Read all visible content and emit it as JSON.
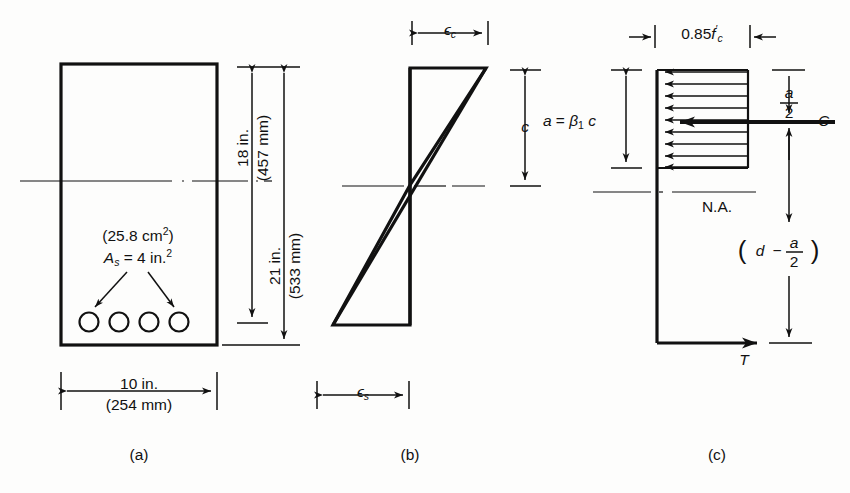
{
  "figure": {
    "title_parts": [
      "(a)",
      "(b)",
      "(c)"
    ],
    "panel_a": {
      "caption": "(a)",
      "area_metric": "(25.8 cm",
      "area_metric_sup": "2",
      "area_metric_close": ")",
      "as_symbol": "A",
      "as_sub": "s",
      "as_value": " = 4 in.",
      "as_sup": "2",
      "dim_depth_in": "18 in.",
      "dim_depth_mm": "(457 mm)",
      "dim_total_in": "21 in.",
      "dim_total_mm": "(533 mm)",
      "dim_width_in": "10 in.",
      "dim_width_mm": "(254 mm)",
      "rebar_count": 4
    },
    "panel_b": {
      "caption": "(b)",
      "strain_top_symbol": "ϵ",
      "strain_top_sub": "c",
      "strain_bottom_symbol": "ϵ",
      "strain_bottom_sub": "s",
      "neutral_depth_label": "c"
    },
    "panel_c": {
      "caption": "(c)",
      "stress_label_prefix": "0.85",
      "stress_label_f": "f",
      "stress_label_prime": "′",
      "stress_label_sub": "c",
      "depth_eq_prefix": "a",
      "depth_eq_equals": " = ",
      "depth_eq_beta": "β",
      "depth_eq_beta_sub": "1",
      "depth_eq_c": "c",
      "half_a_num": "a",
      "half_a_den": "2",
      "compression_label": "C",
      "tension_label": "T",
      "neutral_axis_label": "N.A.",
      "lever_arm_open": "(",
      "lever_arm_d": "d",
      "lever_arm_minus": "−",
      "lever_arm_num": "a",
      "lever_arm_den": "2",
      "lever_arm_close": ")",
      "arrow_count": 9
    },
    "colors": {
      "ink": "#111111",
      "paper": "#fdfdfc"
    }
  }
}
